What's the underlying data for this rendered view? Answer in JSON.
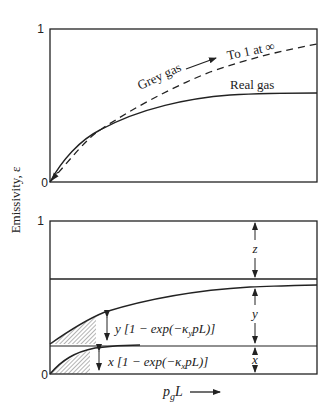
{
  "figure": {
    "ylabel": "Emissivity, ε",
    "xlabel_main": "p",
    "xlabel_sub": "g",
    "xlabel_tail": "L",
    "colors": {
      "ink": "#222222",
      "background": "#ffffff"
    }
  },
  "top_panel": {
    "ytick_top": "1",
    "ytick_bottom": "0",
    "grey_gas_label": "Grey gas",
    "asymptote_label": "To 1 at ∞",
    "real_gas_label": "Real gas"
  },
  "bottom_panel": {
    "ytick_top": "1",
    "ytick_bottom": "0",
    "y_term_label": "y [1 − exp(−κ",
    "y_term_sub": "y",
    "y_term_tail": "pL)]",
    "x_term_label": "x [1 − exp(−κ",
    "x_term_sub": "x",
    "x_term_tail": "pL)]",
    "z_label": "z",
    "y_label": "y",
    "x_label": "x"
  }
}
